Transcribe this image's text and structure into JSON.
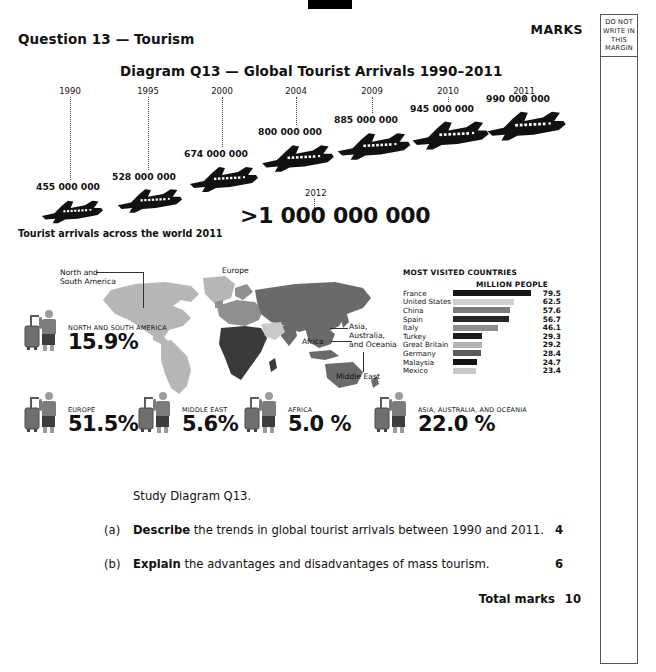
{
  "page": {
    "marks_label": "MARKS",
    "margin_note": [
      "DO NOT",
      "WRITE IN",
      "THIS",
      "MARGIN"
    ],
    "question_title": "Question 13 — Tourism",
    "diagram_title": "Diagram Q13 — Global Tourist Arrivals 1990–2011",
    "map_caption": "Tourist arrivals across the world 2011"
  },
  "timeline": {
    "items": [
      {
        "year": "1990",
        "value": "455 000 000"
      },
      {
        "year": "1995",
        "value": "528 000 000"
      },
      {
        "year": "2000",
        "value": "674 000 000"
      },
      {
        "year": "2004",
        "value": "800 000 000"
      },
      {
        "year": "2009",
        "value": "885 000 000"
      },
      {
        "year": "2010",
        "value": "945 000 000"
      },
      {
        "year": "2011",
        "value": "990 000 000"
      }
    ],
    "highlight": {
      "year": "2012",
      "value": ">1 000 000 000"
    }
  },
  "map_labels": [
    {
      "text": "North and"
    },
    {
      "text": "South America"
    },
    {
      "text": "Europe"
    },
    {
      "text": "Asia,"
    },
    {
      "text": "Australia,"
    },
    {
      "text": "and Oceania"
    },
    {
      "text": "Africa"
    },
    {
      "text": "Middle East"
    }
  ],
  "region_stats": [
    {
      "region": "NORTH AND SOUTH AMERICA",
      "percent": "15.9%"
    },
    {
      "region": "EUROPE",
      "percent": "51.5%"
    },
    {
      "region": "MIDDLE EAST",
      "percent": "5.6%"
    },
    {
      "region": "AFRICA",
      "percent": "5.0 %"
    },
    {
      "region": "ASIA, AUSTRALIA, AND OCEANIA",
      "percent": "22.0 %"
    }
  ],
  "chart_data": {
    "type": "bar",
    "title": "MOST VISITED COUNTRIES",
    "unit_label": "MILLION PEOPLE",
    "xlabel": "",
    "ylabel": "",
    "orientation": "horizontal",
    "categories": [
      "France",
      "United States",
      "China",
      "Spain",
      "Italy",
      "Turkey",
      "Great Britain",
      "Germany",
      "Malaysia",
      "Mexico"
    ],
    "values": [
      79.5,
      62.5,
      57.6,
      56.7,
      46.1,
      29.3,
      29.2,
      28.4,
      24.7,
      23.4
    ],
    "value_labels": [
      "79.5",
      "62.5",
      "57.6",
      "56.7",
      "46.1",
      "29.3",
      "29.2",
      "28.4",
      "24.7",
      "23.4"
    ],
    "bar_colors": [
      "#161616",
      "#cfcfcf",
      "#7b7b7b",
      "#262626",
      "#8e8e8e",
      "#1c1c1c",
      "#b4b4b4",
      "#5b5b5b",
      "#141414",
      "#c7c7c7"
    ],
    "xlim": [
      0,
      79.5
    ],
    "grid": false,
    "legend": false
  },
  "questions": {
    "intro": "Study Diagram Q13.",
    "items": [
      {
        "label": "(a)",
        "bold": "Describe",
        "rest": " the trends in global tourist arrivals between 1990 and 2011.",
        "marks": "4"
      },
      {
        "label": "(b)",
        "bold": "Explain",
        "rest": " the advantages and disadvantages of mass tourism.",
        "marks": "6"
      }
    ],
    "total_label": "Total marks",
    "total_value": "10"
  },
  "colors": {
    "americas": "#b6b6b6",
    "europe": "#8f8f8f",
    "asia": "#6a6a6a",
    "africa": "#3a3a3a",
    "middle_east": "#c9c9c9"
  }
}
